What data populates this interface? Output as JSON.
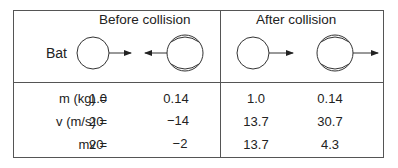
{
  "headers": {
    "before": "Before collision",
    "after": "After collision"
  },
  "labels": {
    "bat": "Bat"
  },
  "icons": {
    "bat_before": "circle-plain-icon",
    "ball_before": "baseball-icon",
    "bat_after": "circle-plain-icon",
    "ball_after": "baseball-icon"
  },
  "rows": [
    {
      "label": "m (kg)  =",
      "bat_before": "1.0",
      "ball_before": "0.14",
      "bat_after": "1.0",
      "ball_after": "0.14"
    },
    {
      "label": "v (m/s)  =",
      "bat_before": "20",
      "ball_before": "−14",
      "bat_after": "13.7",
      "ball_after": "30.7"
    },
    {
      "label": "mv  =",
      "bat_before": "20",
      "ball_before": "−2",
      "bat_after": "13.7",
      "ball_after": "4.3"
    }
  ]
}
